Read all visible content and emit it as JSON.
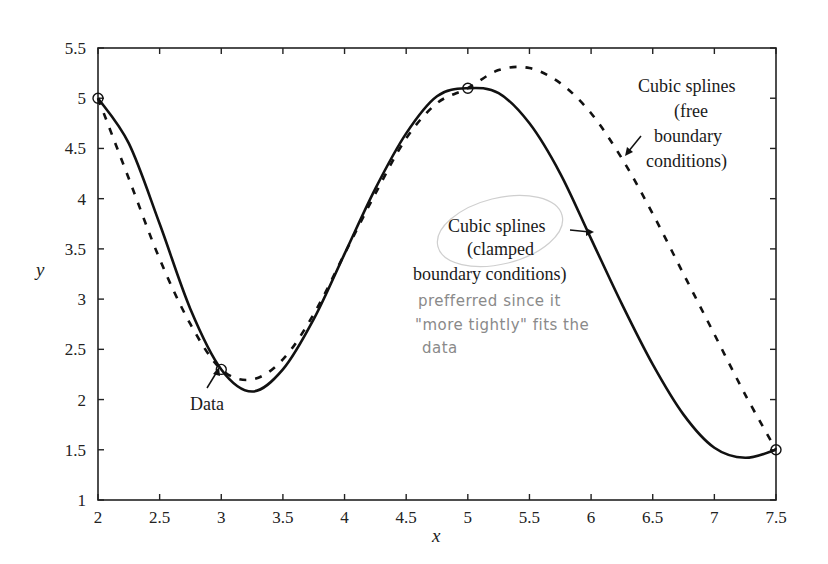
{
  "chart_data": {
    "type": "line",
    "title": "",
    "xlabel": "x",
    "ylabel": "y",
    "xlim": [
      2,
      7.5
    ],
    "ylim": [
      1,
      5.5
    ],
    "grid": false,
    "x_ticks": [
      "2",
      "2.5",
      "3",
      "3.5",
      "4",
      "4.5",
      "5",
      "5.5",
      "6",
      "6.5",
      "7",
      "7.5"
    ],
    "y_ticks": [
      "1",
      "1.5",
      "2",
      "2.5",
      "3",
      "3.5",
      "4",
      "4.5",
      "5",
      "5.5"
    ],
    "data_points": {
      "name": "Data",
      "marker": "open-circle",
      "x": [
        2,
        3,
        5,
        7.5
      ],
      "y": [
        5.0,
        2.3,
        5.1,
        1.5
      ]
    },
    "series": [
      {
        "name": "Cubic splines (clamped boundary conditions)",
        "style": "solid",
        "x": [
          2.0,
          2.25,
          2.5,
          2.75,
          3.0,
          3.25,
          3.5,
          3.75,
          4.0,
          4.25,
          4.5,
          4.75,
          5.0,
          5.25,
          5.5,
          5.75,
          6.0,
          6.25,
          6.5,
          6.75,
          7.0,
          7.25,
          7.5
        ],
        "y": [
          5.0,
          4.55,
          3.75,
          2.9,
          2.3,
          2.08,
          2.3,
          2.8,
          3.45,
          4.1,
          4.65,
          5.02,
          5.1,
          5.05,
          4.75,
          4.25,
          3.6,
          2.95,
          2.35,
          1.85,
          1.52,
          1.42,
          1.5
        ]
      },
      {
        "name": "Cubic splines (free boundary conditions)",
        "style": "dashed",
        "x": [
          2.0,
          2.25,
          2.5,
          2.75,
          3.0,
          3.25,
          3.5,
          3.75,
          4.0,
          4.25,
          4.5,
          4.75,
          5.0,
          5.25,
          5.5,
          5.75,
          6.0,
          6.25,
          6.5,
          6.75,
          7.0,
          7.25,
          7.5
        ],
        "y": [
          5.0,
          4.2,
          3.4,
          2.75,
          2.3,
          2.2,
          2.4,
          2.85,
          3.45,
          4.05,
          4.6,
          4.95,
          5.1,
          5.28,
          5.3,
          5.15,
          4.85,
          4.4,
          3.85,
          3.25,
          2.65,
          2.05,
          1.5
        ]
      }
    ],
    "annotations": [
      {
        "text": "Data",
        "points_to": [
          3,
          2.3
        ]
      },
      {
        "lines": [
          "Cubic splines",
          "(clamped",
          "boundary conditions)"
        ],
        "points_to_series": "clamped"
      },
      {
        "lines": [
          "Cubic splines",
          "(free",
          "boundary",
          "conditions)"
        ],
        "points_to_series": "free"
      }
    ],
    "handwritten_note": [
      "prefferred since it",
      "\"more tightly\" fits the",
      "data"
    ]
  },
  "labels": {
    "x_axis": "x",
    "y_axis": "y",
    "data": "Data",
    "clamped": [
      "Cubic splines",
      "(clamped",
      "boundary conditions)"
    ],
    "free": [
      "Cubic splines",
      "(free",
      "boundary",
      "conditions)"
    ],
    "note": [
      "prefferred since it",
      "\"more tightly\" fits the",
      "data"
    ]
  },
  "colors": {
    "axis": "#222222",
    "curve": "#111111",
    "handwriting": "#8a8a8a"
  }
}
